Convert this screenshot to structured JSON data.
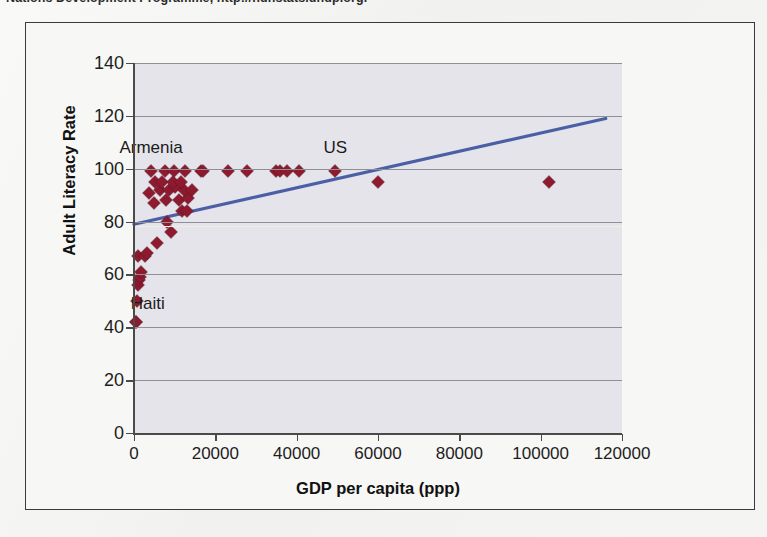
{
  "caption": {
    "text": "Nations Development Programme, http://hdr.stats.undp.org."
  },
  "colors": {
    "marker": "#8e1a30",
    "trendline": "#4a5fa5",
    "plot_background": "#e4e4ea",
    "gridline": "#8f8f96",
    "axis": "#4a4a4a",
    "frame": "#3a3a3a"
  },
  "chart_data": {
    "type": "scatter",
    "title": "",
    "xlabel": "GDP per capita (ppp)",
    "ylabel": "Adult Literacy Rate",
    "xlim": [
      0,
      120000
    ],
    "ylim": [
      0,
      140
    ],
    "xticks": [
      "0",
      "20000",
      "40000",
      "60000",
      "80000",
      "100000",
      "120000"
    ],
    "yticks": [
      "0",
      "20",
      "40",
      "60",
      "80",
      "100",
      "120",
      "140"
    ],
    "grid": "horizontal",
    "legend": "none",
    "series": [
      {
        "name": "Countries",
        "marker": "diamond",
        "points": [
          {
            "x": 500,
            "y": 42
          },
          {
            "x": 600,
            "y": 42
          },
          {
            "x": 700,
            "y": 50
          },
          {
            "x": 1100,
            "y": 56
          },
          {
            "x": 1300,
            "y": 58
          },
          {
            "x": 1500,
            "y": 59
          },
          {
            "x": 1600,
            "y": 61
          },
          {
            "x": 900,
            "y": 67
          },
          {
            "x": 2600,
            "y": 67
          },
          {
            "x": 3300,
            "y": 68
          },
          {
            "x": 5600,
            "y": 72
          },
          {
            "x": 9200,
            "y": 76
          },
          {
            "x": 8200,
            "y": 80
          },
          {
            "x": 11800,
            "y": 84
          },
          {
            "x": 13000,
            "y": 84
          },
          {
            "x": 4800,
            "y": 87
          },
          {
            "x": 7900,
            "y": 88
          },
          {
            "x": 11000,
            "y": 88
          },
          {
            "x": 13200,
            "y": 89
          },
          {
            "x": 3600,
            "y": 91
          },
          {
            "x": 6400,
            "y": 92
          },
          {
            "x": 8700,
            "y": 92
          },
          {
            "x": 10000,
            "y": 93
          },
          {
            "x": 12200,
            "y": 92
          },
          {
            "x": 14200,
            "y": 92
          },
          {
            "x": 5200,
            "y": 95
          },
          {
            "x": 7000,
            "y": 95
          },
          {
            "x": 9500,
            "y": 95
          },
          {
            "x": 11500,
            "y": 95
          },
          {
            "x": 60000,
            "y": 95
          },
          {
            "x": 102000,
            "y": 95
          },
          {
            "x": 4200,
            "y": 99
          },
          {
            "x": 7700,
            "y": 99
          },
          {
            "x": 9900,
            "y": 99
          },
          {
            "x": 12600,
            "y": 99
          },
          {
            "x": 16400,
            "y": 99
          },
          {
            "x": 17000,
            "y": 99
          },
          {
            "x": 23000,
            "y": 99
          },
          {
            "x": 27800,
            "y": 99
          },
          {
            "x": 34800,
            "y": 99
          },
          {
            "x": 36000,
            "y": 99
          },
          {
            "x": 37600,
            "y": 99
          },
          {
            "x": 40600,
            "y": 99
          },
          {
            "x": 49500,
            "y": 99
          }
        ]
      }
    ],
    "trendline": {
      "name": "linear fit",
      "x_start": 0,
      "y_start": 79,
      "x_end": 116000,
      "y_end": 119
    },
    "annotations": [
      {
        "label": "Armenia",
        "x": 4200,
        "y": 104
      },
      {
        "label": "Haiti",
        "x": 3400,
        "y": 45
      },
      {
        "label": "US",
        "x": 49500,
        "y": 104
      }
    ]
  }
}
